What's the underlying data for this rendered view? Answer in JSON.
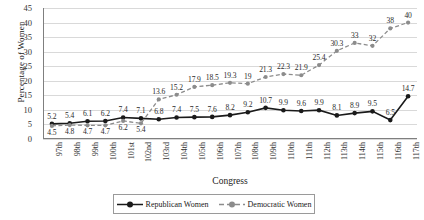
{
  "chart_data": {
    "type": "line",
    "title": "",
    "xlabel": "Congress",
    "ylabel": "Percentage of Women",
    "ylim": [
      0,
      45
    ],
    "ytick_step": 5,
    "yticks": [
      0,
      5,
      10,
      15,
      20,
      25,
      30,
      35,
      40,
      45
    ],
    "grid": true,
    "legend_position": "bottom",
    "categories": [
      "97th",
      "98th",
      "99th",
      "100th",
      "101st",
      "102nd",
      "103rd",
      "104th",
      "105th",
      "106th",
      "107th",
      "108th",
      "109th",
      "110th",
      "111th",
      "112th",
      "113th",
      "114th",
      "115th",
      "116th",
      "117th"
    ],
    "series": [
      {
        "name": "Republican Women",
        "color": "#1a1a1a",
        "style": "solid",
        "marker": "circle",
        "values": [
          5.2,
          5.4,
          6.1,
          6.2,
          7.4,
          7.1,
          6.8,
          7.4,
          7.5,
          7.6,
          8.2,
          9.2,
          10.7,
          9.9,
          9.6,
          9.9,
          8.1,
          8.9,
          9.5,
          6.5,
          14.7
        ],
        "label_position": "above"
      },
      {
        "name": "Democratic Women",
        "color": "#8c8c8c",
        "style": "dashed",
        "marker": "circle",
        "values": [
          4.5,
          4.8,
          4.7,
          4.7,
          6.2,
          5.4,
          13.6,
          15.2,
          17.9,
          18.5,
          19.3,
          19,
          21.3,
          22.3,
          21.9,
          25.4,
          30.3,
          33,
          32,
          38,
          40
        ],
        "label_position": "mixed"
      }
    ]
  },
  "axes": {
    "y_title": "Percentage of Women",
    "x_title": "Congress"
  },
  "legend": {
    "items": [
      {
        "label": "Republican Women"
      },
      {
        "label": "Democratic Women"
      }
    ]
  }
}
